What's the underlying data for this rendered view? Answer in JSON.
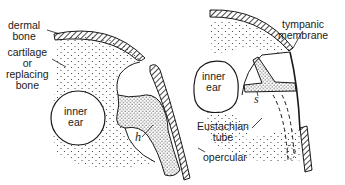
{
  "figure": {
    "left_panel": {
      "labels": {
        "dermal_bone": [
          "dermal",
          "bone"
        ],
        "cartilage": [
          "cartilage",
          "or",
          "replacing",
          "bone"
        ],
        "inner_ear": [
          "inner",
          "ear"
        ],
        "h": "h",
        "opercular": "opercular"
      }
    },
    "right_panel": {
      "labels": {
        "tympanic_membrane": [
          "tympanic",
          "membrane"
        ],
        "inner_ear": [
          "inner",
          "ear"
        ],
        "s": "s",
        "eustachian_tube": [
          "Eustachian",
          "tube"
        ]
      }
    },
    "colors": {
      "ink": "#1a1a1a",
      "background": "#ffffff"
    }
  }
}
